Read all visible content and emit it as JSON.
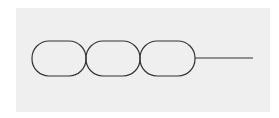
{
  "diagram": {
    "background_color": "#efefef",
    "stroke_color": "#333333",
    "nodes": [
      {
        "id": "capsule-1",
        "x": 32,
        "y": 41,
        "width": 54,
        "height": 35
      },
      {
        "id": "capsule-2",
        "x": 86,
        "y": 41,
        "width": 54,
        "height": 35
      },
      {
        "id": "capsule-3",
        "x": 140,
        "y": 41,
        "width": 55,
        "height": 35
      }
    ],
    "tail": {
      "x1": 195,
      "y1": 58,
      "x2": 253,
      "y2": 58
    }
  }
}
